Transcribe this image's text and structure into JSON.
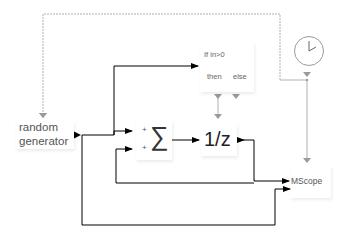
{
  "diagram": {
    "blocks": {
      "random_generator": {
        "line1": "random",
        "line2": "generator"
      },
      "if_block": {
        "condition": "If in>0",
        "then_label": "then",
        "else_label": "else"
      },
      "sum": {
        "plus1": "+",
        "plus2": "+",
        "symbol": "∑"
      },
      "delay": {
        "label": "1/z"
      },
      "clock": {
        "icon": "clock-icon"
      },
      "scope": {
        "label": "MScope"
      }
    },
    "colors": {
      "data_link": "#000000",
      "activation_link": "#a8a8a8"
    }
  }
}
